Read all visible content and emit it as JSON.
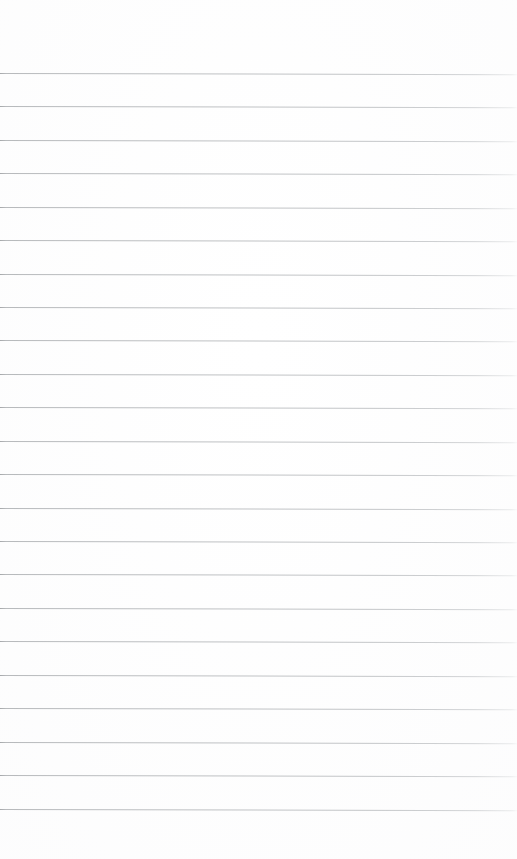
{
  "document": {
    "kind": "lined-notebook-paper",
    "title": "Blank Lined Paper",
    "page_number": "",
    "content_text": "",
    "annotations": []
  },
  "canvas": {
    "width": 517,
    "height": 859,
    "background_color": "#ffffff"
  },
  "ruling": {
    "style": "wide-ruled-horizontal",
    "line_color": "#aaadb0",
    "line_thickness_px": 1,
    "line_count": 23,
    "first_line_y": 73,
    "line_spacing_px": 33.45,
    "last_line_y": 809,
    "left_margin_px": 0,
    "right_margin_px": 0,
    "top_margin_px": 73,
    "bottom_margin_px": 50,
    "skew_degrees": 0.13,
    "has_vertical_margin_rule": false,
    "lines": [
      {
        "index": 1,
        "y": 73
      },
      {
        "index": 2,
        "y": 106
      },
      {
        "index": 3,
        "y": 140
      },
      {
        "index": 4,
        "y": 173
      },
      {
        "index": 5,
        "y": 207
      },
      {
        "index": 6,
        "y": 240
      },
      {
        "index": 7,
        "y": 274
      },
      {
        "index": 8,
        "y": 307
      },
      {
        "index": 9,
        "y": 340
      },
      {
        "index": 10,
        "y": 374
      },
      {
        "index": 11,
        "y": 407
      },
      {
        "index": 12,
        "y": 441
      },
      {
        "index": 13,
        "y": 474
      },
      {
        "index": 14,
        "y": 508
      },
      {
        "index": 15,
        "y": 541
      },
      {
        "index": 16,
        "y": 574
      },
      {
        "index": 17,
        "y": 608
      },
      {
        "index": 18,
        "y": 641
      },
      {
        "index": 19,
        "y": 675
      },
      {
        "index": 20,
        "y": 708
      },
      {
        "index": 21,
        "y": 742
      },
      {
        "index": 22,
        "y": 775
      },
      {
        "index": 23,
        "y": 809
      }
    ]
  }
}
